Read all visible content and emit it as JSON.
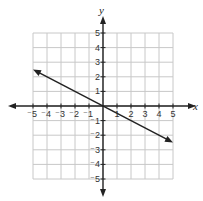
{
  "chart_data": {
    "type": "line",
    "title": "",
    "xlabel": "x",
    "ylabel": "y",
    "xlim": [
      -5,
      5
    ],
    "ylim": [
      -5,
      5
    ],
    "grid": true,
    "x_ticks": [
      -5,
      -4,
      -3,
      -2,
      -1,
      1,
      2,
      3,
      4,
      5
    ],
    "y_ticks": [
      -5,
      -4,
      -3,
      -2,
      -1,
      1,
      2,
      3,
      4,
      5
    ],
    "x_tick_labels": [
      "⁻5",
      "⁻4",
      "⁻3",
      "⁻2",
      "⁻1",
      "1",
      "2",
      "3",
      "4",
      "5"
    ],
    "y_tick_labels": [
      "⁻5",
      "⁻4",
      "⁻3",
      "⁻2",
      "⁻1",
      "1",
      "2",
      "3",
      "4",
      "5"
    ],
    "series": [
      {
        "name": "line",
        "equation": "y = -0.5x",
        "x": [
          -5,
          0,
          5
        ],
        "y": [
          2.5,
          0,
          -2.5
        ],
        "arrows": "both"
      }
    ],
    "legend": null
  },
  "colors": {
    "grid": "#c8c8c8",
    "axes": "#222222",
    "line": "#222222"
  }
}
